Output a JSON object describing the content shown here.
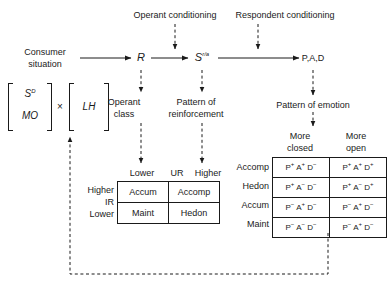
{
  "diagram": {
    "title_nodes": {
      "operant_conditioning": "Operant conditioning",
      "respondent_conditioning": "Respondent conditioning"
    },
    "flow": {
      "consumer_situation_line1": "Consumer",
      "consumer_situation_line2": "situation",
      "response": "R",
      "stimulus": "S",
      "stimulus_superscript": "r/a",
      "outcome": "P,A,D"
    },
    "antecedents": {
      "sd": "S",
      "sd_superscript": "D",
      "mo": "MO",
      "operator": "×",
      "lh": "LH"
    },
    "mid_labels": {
      "operant_class_line1": "Operant",
      "operant_class_line2": "class",
      "pattern_reinforcement_line1": "Pattern of",
      "pattern_reinforcement_line2": "reinforcement",
      "pattern_emotion": "Pattern of emotion"
    },
    "left_matrix": {
      "col_lower": "Lower",
      "col_axis": "UR",
      "col_higher": "Higher",
      "row_axis_top": "Higher",
      "row_axis_mid": "IR",
      "row_axis_bottom": "Lower",
      "cells": [
        [
          "Accum",
          "Accomp"
        ],
        [
          "Maint",
          "Hedon"
        ]
      ]
    },
    "right_matrix": {
      "col_closed_line1": "More",
      "col_closed_line2": "closed",
      "col_open_line1": "More",
      "col_open_line2": "open",
      "rows": [
        {
          "label": "Accomp",
          "closed": [
            [
              "P",
              "+"
            ],
            [
              "A",
              "+"
            ],
            [
              "D",
              "−"
            ]
          ],
          "open": [
            [
              "P",
              "+"
            ],
            [
              "A",
              "+"
            ],
            [
              "D",
              "+"
            ]
          ]
        },
        {
          "label": "Hedon",
          "closed": [
            [
              "P",
              "+"
            ],
            [
              "A",
              "−"
            ],
            [
              "D",
              "−"
            ]
          ],
          "open": [
            [
              "P",
              "+"
            ],
            [
              "A",
              "−"
            ],
            [
              "D",
              "+"
            ]
          ]
        },
        {
          "label": "Accum",
          "closed": [
            [
              "P",
              "−"
            ],
            [
              "A",
              "+"
            ],
            [
              "D",
              "−"
            ]
          ],
          "open": [
            [
              "P",
              "−"
            ],
            [
              "A",
              "+"
            ],
            [
              "D",
              "−"
            ]
          ]
        },
        {
          "label": "Maint",
          "closed": [
            [
              "P",
              "−"
            ],
            [
              "A",
              "−"
            ],
            [
              "D",
              "−"
            ]
          ],
          "open": [
            [
              "P",
              "−"
            ],
            [
              "A",
              "+"
            ],
            [
              "D",
              "−"
            ]
          ]
        }
      ]
    },
    "colors": {
      "ink": "#1a1a1a",
      "background": "#ffffff"
    }
  }
}
